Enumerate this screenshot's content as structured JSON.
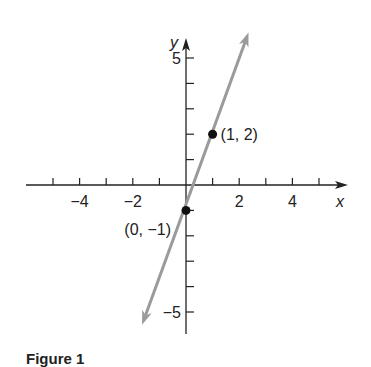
{
  "chart_data": {
    "type": "line",
    "title": "",
    "xlabel": "x",
    "ylabel": "y",
    "xlim": [
      -5,
      5
    ],
    "ylim": [
      -5,
      5
    ],
    "grid": false,
    "x_ticks": [
      -5,
      -4,
      -3,
      -2,
      -1,
      1,
      2,
      3,
      4,
      5
    ],
    "x_tick_labels": [
      {
        "value": -4,
        "label": "−4"
      },
      {
        "value": -2,
        "label": "−2"
      },
      {
        "value": 2,
        "label": "2"
      },
      {
        "value": 4,
        "label": "4"
      }
    ],
    "y_ticks": [
      -5,
      -4,
      -3,
      -2,
      -1,
      1,
      2,
      3,
      4,
      5
    ],
    "y_tick_labels": [
      {
        "value": 5,
        "label": "5"
      },
      {
        "value": -5,
        "label": "−5"
      }
    ],
    "series": [
      {
        "name": "y = 3x - 1",
        "color": "#9a9a9a",
        "x": [
          -1.65,
          2.35
        ],
        "y": [
          -5.5,
          6.0
        ]
      }
    ],
    "points": [
      {
        "x": 1,
        "y": 2,
        "label": "(1, 2)"
      },
      {
        "x": 0,
        "y": -1,
        "label": "(0, −1)"
      }
    ],
    "caption": "Figure 1"
  },
  "layout": {
    "origin_px": [
      186,
      185
    ],
    "unit_x_px": 26.6,
    "unit_y_px": 25.4
  }
}
